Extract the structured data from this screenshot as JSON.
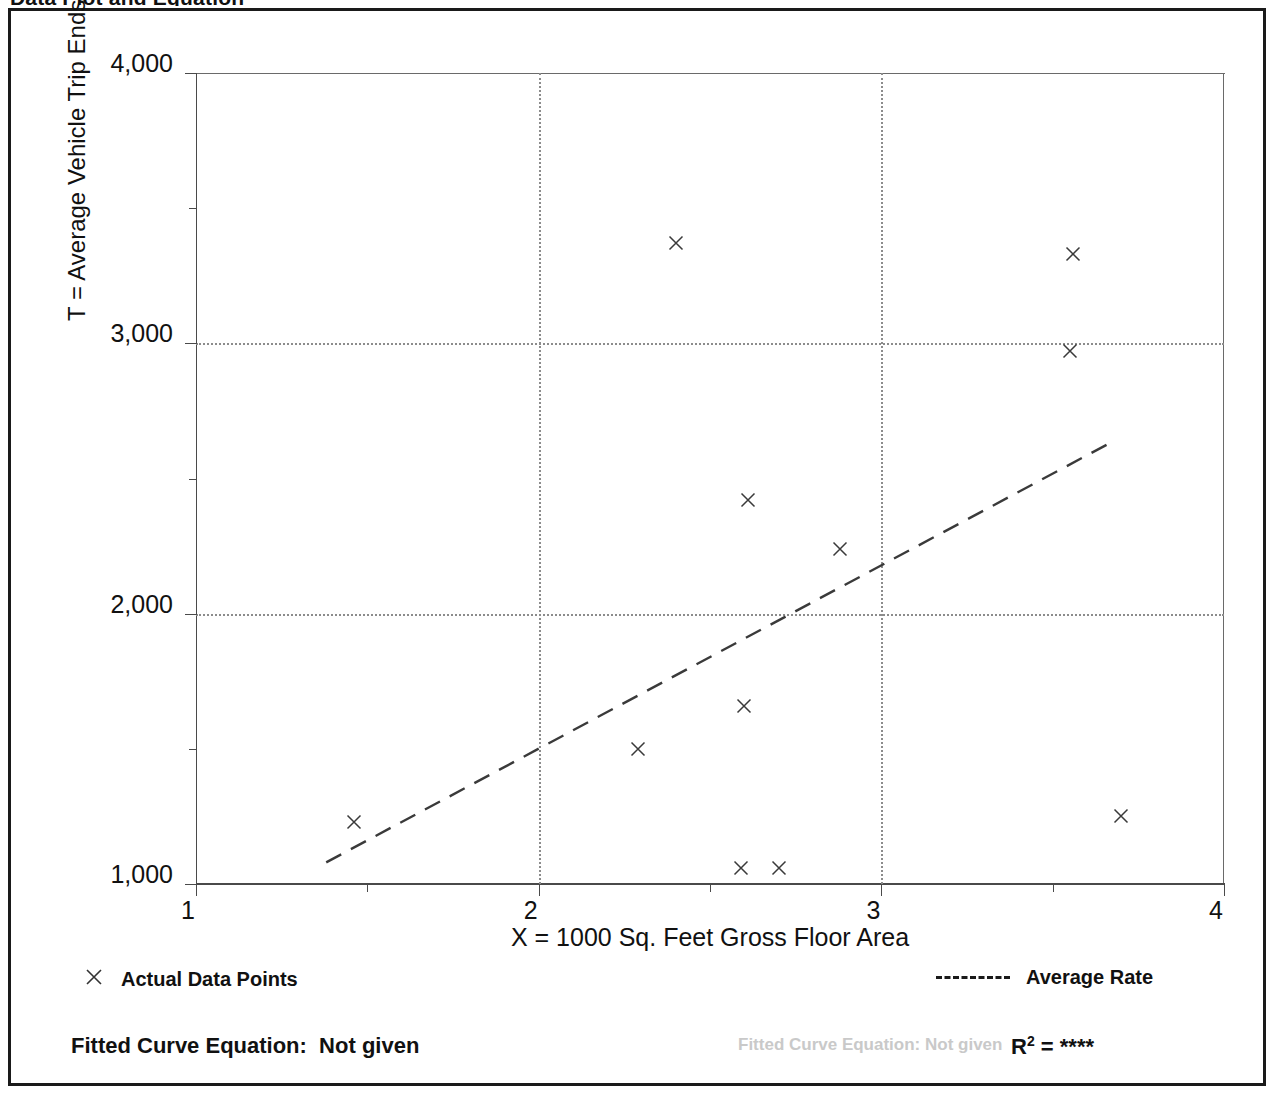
{
  "page": {
    "title_partial": "Data Plot and Equation",
    "background_color": "#ffffff",
    "ink_color": "#111111"
  },
  "axis": {
    "y_title": "T = Average Vehicle Trip Ends",
    "x_title": "X = 1000 Sq. Feet Gross Floor Area",
    "y_ticks": [
      "1,000",
      "2,000",
      "3,000",
      "4,000"
    ],
    "x_ticks": [
      "1",
      "2",
      "3",
      "4"
    ]
  },
  "legend": {
    "marker_icon": "x-marker-icon",
    "points_label": "Actual Data Points",
    "line_icon": "dashed-line-icon",
    "rate_label": "Average Rate"
  },
  "footer": {
    "fitted_label": "Fitted Curve Equation:  Not given",
    "r_squared_prefix": "R",
    "r_squared_exponent": "2",
    "r_squared_value": " = ****"
  },
  "ghosts": [
    {
      "text": "Fitted Curve Equation:  Not given",
      "left": 735,
      "top": 1032
    }
  ],
  "chart_data": {
    "type": "scatter",
    "title": "Data Plot and Equation",
    "xlabel": "X = 1000 Sq. Feet Gross Floor Area",
    "ylabel": "T = Average Vehicle Trip Ends",
    "xlim": [
      1,
      4
    ],
    "ylim": [
      1000,
      4000
    ],
    "x_major_ticks": [
      1,
      2,
      3,
      4
    ],
    "x_minor_ticks": [
      1.5,
      2.5,
      3.5
    ],
    "y_major_ticks": [
      1000,
      2000,
      3000,
      4000
    ],
    "y_minor_ticks": [
      1500,
      2500,
      3500
    ],
    "grid": true,
    "gridlines_x": [
      2,
      3
    ],
    "gridlines_y": [
      2000,
      3000
    ],
    "legend_position": "below-axes",
    "series": [
      {
        "name": "Actual Data Points",
        "type": "scatter",
        "marker": "x",
        "points": [
          {
            "x": 1.46,
            "y": 1230
          },
          {
            "x": 2.29,
            "y": 1500
          },
          {
            "x": 2.4,
            "y": 3370
          },
          {
            "x": 2.59,
            "y": 1060
          },
          {
            "x": 2.6,
            "y": 1660
          },
          {
            "x": 2.61,
            "y": 2420
          },
          {
            "x": 2.7,
            "y": 1060
          },
          {
            "x": 2.88,
            "y": 2240
          },
          {
            "x": 3.55,
            "y": 2970
          },
          {
            "x": 3.56,
            "y": 3330
          },
          {
            "x": 3.7,
            "y": 1250
          }
        ]
      },
      {
        "name": "Average Rate",
        "type": "line",
        "style": "dashed",
        "endpoints": [
          {
            "x": 1.38,
            "y": 1080
          },
          {
            "x": 3.68,
            "y": 2640
          }
        ]
      }
    ]
  }
}
